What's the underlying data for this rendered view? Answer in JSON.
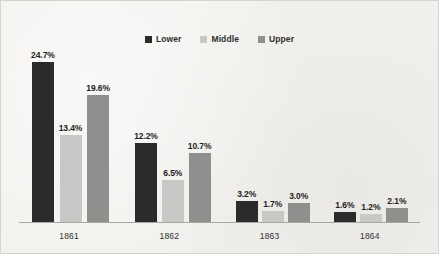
{
  "chart_data": {
    "type": "bar",
    "title": "",
    "subtitle": "",
    "xlabel": "",
    "ylabel": "",
    "categories": [
      "1861",
      "1862",
      "1863",
      "1864"
    ],
    "series": [
      {
        "name": "Lower",
        "color": "#2b2b2b",
        "values": [
          24.7,
          12.2,
          3.2,
          1.6
        ],
        "labels": [
          "24.7%",
          "12.2%",
          "3.2%",
          "1.6%"
        ]
      },
      {
        "name": "Middle",
        "color": "#c9c8c6",
        "values": [
          13.4,
          6.5,
          1.7,
          1.2
        ],
        "labels": [
          "13.4%",
          "6.5%",
          "1.7%",
          "1.2%"
        ]
      },
      {
        "name": "Upper",
        "color": "#8f8f8d",
        "values": [
          19.6,
          10.7,
          3.0,
          2.1
        ],
        "labels": [
          "19.6%",
          "10.7%",
          "3.0%",
          "2.1%"
        ]
      }
    ],
    "ylim": [
      0,
      26
    ],
    "grid": false,
    "legend_position": "top-center",
    "value_suffix": "%"
  },
  "legend": {
    "items": [
      {
        "label": "Lower",
        "color": "#2b2b2b"
      },
      {
        "label": "Middle",
        "color": "#c9c8c6"
      },
      {
        "label": "Upper",
        "color": "#8f8f8d"
      }
    ]
  },
  "colors": {
    "background": "#f2f1ee",
    "border": "#d6d4cf",
    "axis": "#a9a7a2",
    "label_text": "#232323",
    "tick_text": "#2f2f2f"
  }
}
